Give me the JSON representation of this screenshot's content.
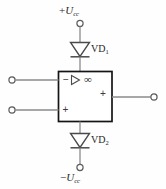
{
  "figure": {
    "kind": "circuit-diagram",
    "width": 166,
    "height": 189,
    "background": "#fefefe",
    "line_color": "#6e6e6e",
    "box_color": "#1a1a1a",
    "text_color": "#2b2b2b"
  },
  "rails": {
    "positive": {
      "sign": "+",
      "symbol": "U",
      "subscript": "cc",
      "text": "+Ucc"
    },
    "negative": {
      "sign": "−",
      "symbol": "U",
      "subscript": "cc",
      "text": "−Ucc"
    }
  },
  "diodes": [
    {
      "name": "VD",
      "subscript": "1",
      "text": "VD1",
      "orientation": "cathode-down"
    },
    {
      "name": "VD",
      "subscript": "2",
      "text": "VD2",
      "orientation": "cathode-down"
    }
  ],
  "amplifier": {
    "inverting_sign": "−",
    "noninverting_sign": "+",
    "output_sign": "+",
    "gain_symbol": "∞",
    "amp_glyph": "triangle-right"
  },
  "terminals": {
    "supply_positive": "terminal-circle",
    "supply_negative": "terminal-circle",
    "input_inverting": "terminal-circle",
    "input_noninverting": "terminal-circle",
    "output": "terminal-circle"
  }
}
